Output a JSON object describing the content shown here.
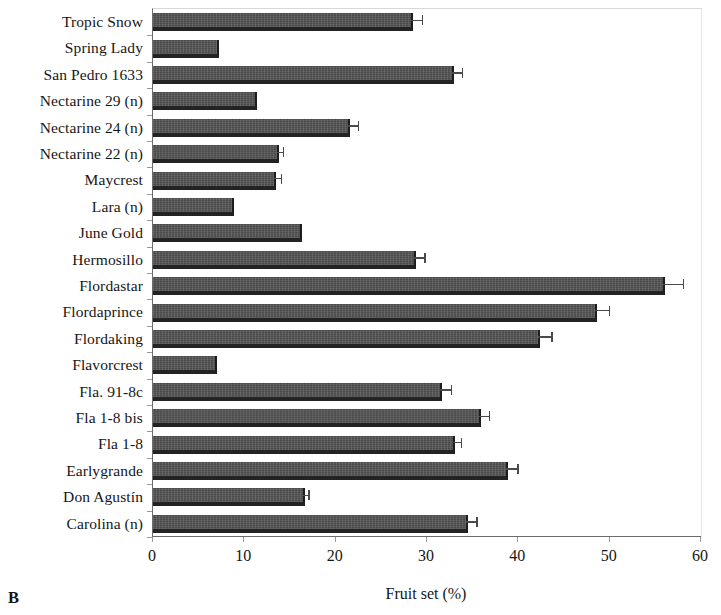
{
  "panel": {
    "label": "B"
  },
  "chart_data": {
    "type": "bar",
    "orientation": "horizontal",
    "title": "",
    "subtitle": "",
    "xlabel": "Fruit set (%)",
    "ylabel": "",
    "xlim": [
      0,
      60
    ],
    "ylim": null,
    "xticks": [
      0,
      10,
      20,
      30,
      40,
      50,
      60
    ],
    "xtick_labels": [
      "0",
      "10",
      "20",
      "30",
      "40",
      "50",
      "60"
    ],
    "grid": false,
    "legend": null,
    "legend_position": "none",
    "bar_color": "#4b4b4b",
    "error_bar_color": "#4a4a4a",
    "axis_color": "#6b6b6b",
    "categories": [
      "Tropic Snow",
      "Spring Lady",
      "San Pedro 1633",
      "Nectarine 29 (n)",
      "Nectarine 24 (n)",
      "Nectarine 22 (n)",
      "Maycrest",
      "Lara (n)",
      "June Gold",
      "Hermosillo",
      "Flordastar",
      "Flordaprince",
      "Flordaking",
      "Flavorcrest",
      "Fla. 91-8c",
      "Fla 1-8 bis",
      "Fla 1-8",
      "Earlygrande",
      "Don Agustín",
      "Carolina (n)"
    ],
    "values": [
      28.2,
      7.0,
      32.7,
      11.2,
      21.4,
      13.6,
      13.2,
      8.6,
      16.1,
      28.6,
      55.8,
      48.4,
      42.2,
      6.8,
      31.4,
      35.7,
      32.8,
      38.6,
      16.4,
      34.3
    ],
    "errors": [
      1.2,
      0.0,
      1.1,
      0.0,
      1.0,
      0.6,
      0.8,
      0.0,
      0.0,
      1.1,
      2.2,
      1.5,
      1.4,
      0.0,
      1.2,
      1.1,
      0.9,
      1.3,
      0.6,
      1.1
    ]
  }
}
